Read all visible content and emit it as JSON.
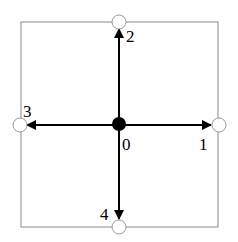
{
  "diagram": {
    "type": "lattice-velocity-stencil",
    "colors": {
      "border": "#8a8a8a",
      "arrow": "#000000",
      "center_node_fill": "#000000",
      "neighbor_node_fill": "#ffffff",
      "neighbor_node_stroke": "#9a9a9a"
    },
    "center": {
      "label": "0",
      "x": 119,
      "y": 125
    },
    "directions": [
      {
        "id": 1,
        "label": "1",
        "direction": "east",
        "node": {
          "x": 219,
          "y": 125
        }
      },
      {
        "id": 2,
        "label": "2",
        "direction": "north",
        "node": {
          "x": 119,
          "y": 22
        }
      },
      {
        "id": 3,
        "label": "3",
        "direction": "west",
        "node": {
          "x": 20,
          "y": 125
        }
      },
      {
        "id": 4,
        "label": "4",
        "direction": "south",
        "node": {
          "x": 119,
          "y": 227
        }
      }
    ],
    "labels": {
      "center": "0",
      "east": "1",
      "north": "2",
      "west": "3",
      "south": "4"
    }
  }
}
